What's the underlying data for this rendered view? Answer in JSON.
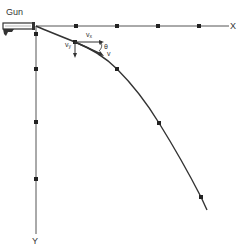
{
  "diagram": {
    "labels": {
      "gun": "Gun",
      "x_axis": "X",
      "y_axis": "Y",
      "vx": "vx",
      "vx_main": "v",
      "vx_sub": "x",
      "vy_main": "v",
      "vy_sub": "y",
      "v": "v",
      "theta": "θ"
    },
    "origin": [
      36,
      26
    ],
    "x_axis_dots": [
      76,
      117,
      158,
      199
    ],
    "y_axis_dots": [
      69,
      122,
      179
    ],
    "trajectory_dots": [
      [
        75,
        42
      ],
      [
        117,
        69
      ],
      [
        159,
        123
      ],
      [
        201,
        197
      ]
    ],
    "colors": {
      "line": "#333333",
      "dot": "#222222",
      "axis": "#555555"
    }
  }
}
